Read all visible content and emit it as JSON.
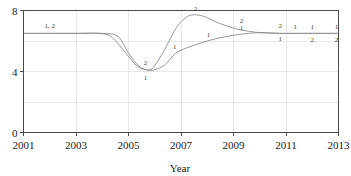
{
  "chart_data": {
    "type": "line",
    "title": "",
    "xlabel": "Year",
    "ylabel": "",
    "xlim": [
      2001,
      2013
    ],
    "ylim": [
      0,
      8
    ],
    "xticks": [
      2001,
      2003,
      2005,
      2007,
      2009,
      2011,
      2013
    ],
    "yticks": [
      0,
      4,
      8
    ],
    "grid": true,
    "legend": "none",
    "series": [
      {
        "name": "1",
        "label": "1",
        "color": "#8c8c8c",
        "x": [
          2001,
          2002,
          2003,
          2004,
          2004.6,
          2005,
          2005.4,
          2005.7,
          2006,
          2006.4,
          2006.8,
          2007.3,
          2008,
          2008.6,
          2009.3,
          2010,
          2010.8,
          2011.4,
          2012,
          2013
        ],
        "y": [
          6.5,
          6.5,
          6.5,
          6.5,
          6.3,
          5.2,
          4.35,
          4.1,
          4.12,
          4.45,
          5.2,
          5.6,
          6.0,
          6.25,
          6.45,
          6.55,
          6.5,
          6.5,
          6.5,
          6.5
        ]
      },
      {
        "name": "2",
        "label": "2",
        "color": "#8c8c8c",
        "x": [
          2001,
          2002,
          2003,
          2004,
          2004.4,
          2004.9,
          2005.3,
          2005.6,
          2005.9,
          2006.3,
          2006.8,
          2007.2,
          2007.5,
          2007.9,
          2008.4,
          2009.0,
          2009.3,
          2010,
          2010.8,
          2011.4,
          2012,
          2013
        ],
        "y": [
          6.5,
          6.5,
          6.5,
          6.48,
          6.2,
          5.2,
          4.4,
          4.15,
          4.2,
          5.2,
          6.8,
          7.55,
          7.72,
          7.6,
          7.2,
          6.85,
          6.72,
          6.55,
          6.5,
          6.5,
          6.5,
          6.5
        ]
      }
    ],
    "point_labels": [
      {
        "text": "1, 2",
        "x": 2002.0,
        "y": 6.5,
        "dx": 0,
        "dy": -5
      },
      {
        "text": "2",
        "x": 2005.65,
        "y": 4.15,
        "dx": 0,
        "dy": -4
      },
      {
        "text": "1",
        "x": 2005.65,
        "y": 4.1,
        "dx": 0,
        "dy": 10
      },
      {
        "text": "1",
        "x": 2006.8,
        "y": 5.2,
        "dx": -1,
        "dy": -4
      },
      {
        "text": "2",
        "x": 2007.55,
        "y": 7.72,
        "dx": 0,
        "dy": -4
      },
      {
        "text": "1",
        "x": 2008.05,
        "y": 6.0,
        "dx": 0,
        "dy": -4
      },
      {
        "text": "2",
        "x": 2009.3,
        "y": 6.95,
        "dx": 0,
        "dy": -4
      },
      {
        "text": "1",
        "x": 2009.3,
        "y": 6.5,
        "dx": 0,
        "dy": -3
      },
      {
        "text": "2",
        "x": 2010.78,
        "y": 6.62,
        "dx": 0,
        "dy": -4
      },
      {
        "text": "1",
        "x": 2010.78,
        "y": 6.5,
        "dx": 0,
        "dy": 8
      },
      {
        "text": "1",
        "x": 2011.35,
        "y": 6.55,
        "dx": 0,
        "dy": -4
      },
      {
        "text": "1",
        "x": 2012.0,
        "y": 6.55,
        "dx": 0,
        "dy": -4
      },
      {
        "text": "2",
        "x": 2012.0,
        "y": 6.5,
        "dx": 0,
        "dy": 9
      },
      {
        "text": "1",
        "x": 2012.92,
        "y": 6.55,
        "dx": 0,
        "dy": -4
      },
      {
        "text": "2",
        "x": 2012.92,
        "y": 6.5,
        "dx": 0,
        "dy": 9
      }
    ]
  },
  "axes": {
    "x_axis_title": "Year",
    "x_tick_labels": [
      "2001",
      "2003",
      "2005",
      "2007",
      "2009",
      "2011",
      "2013"
    ],
    "y_tick_labels": [
      "8",
      "4",
      "0"
    ]
  },
  "colors": {
    "series_line": "#8c8c8c",
    "grid": "#dedede",
    "frame": "#4a4a4a",
    "text": "#1a1a1a",
    "label_text": "#3d3d3d",
    "background": "#ffffff"
  }
}
